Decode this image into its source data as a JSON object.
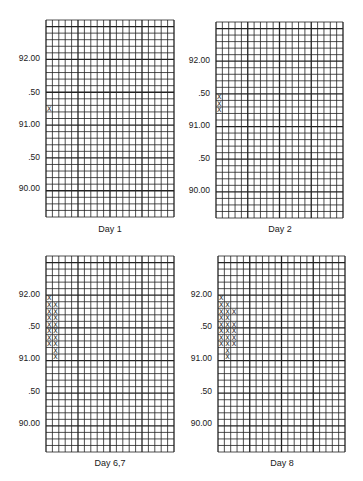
{
  "chart_data": [
    {
      "type": "heatmap",
      "title": "Day 1",
      "caption": "Day 1",
      "xlabel": "",
      "ylabel": "",
      "yticks": [
        "92.00",
        ".50",
        "91.00",
        ".50",
        "90.00"
      ],
      "ytick_values": [
        92.0,
        91.5,
        91.0,
        90.5,
        90.0
      ],
      "ylim": [
        89.6,
        92.6
      ],
      "grid": true,
      "grid_cols": 20,
      "grid_rows": 30,
      "cell_size": 0.1,
      "marks": [
        {
          "col": 0,
          "value": 91.2
        }
      ]
    },
    {
      "type": "heatmap",
      "title": "Day 2",
      "caption": "Day 2",
      "yticks": [
        "92.00",
        ".50",
        "91.00",
        ".50",
        "90.00"
      ],
      "ytick_values": [
        92.0,
        91.5,
        91.0,
        90.5,
        90.0
      ],
      "ylim": [
        89.6,
        92.6
      ],
      "grid": true,
      "grid_cols": 20,
      "grid_rows": 30,
      "cell_size": 0.1,
      "marks": [
        {
          "col": 0,
          "value": 91.4
        },
        {
          "col": 0,
          "value": 91.3
        },
        {
          "col": 0,
          "value": 91.2
        }
      ]
    },
    {
      "type": "heatmap",
      "title": "Day 6,7",
      "caption": "Day 6,7",
      "yticks": [
        "92.00",
        ".50",
        "91.00",
        ".50",
        "90.00"
      ],
      "ytick_values": [
        92.0,
        91.5,
        91.0,
        90.5,
        90.0
      ],
      "ylim": [
        89.6,
        92.6
      ],
      "grid": true,
      "grid_cols": 20,
      "grid_rows": 30,
      "cell_size": 0.1,
      "marks": [
        {
          "col": 0,
          "value": 91.9
        },
        {
          "col": 0,
          "value": 91.8
        },
        {
          "col": 1,
          "value": 91.8
        },
        {
          "col": 0,
          "value": 91.7
        },
        {
          "col": 1,
          "value": 91.7
        },
        {
          "col": 0,
          "value": 91.6
        },
        {
          "col": 1,
          "value": 91.6
        },
        {
          "col": 0,
          "value": 91.5
        },
        {
          "col": 1,
          "value": 91.5
        },
        {
          "col": 0,
          "value": 91.4
        },
        {
          "col": 1,
          "value": 91.4
        },
        {
          "col": 0,
          "value": 91.3
        },
        {
          "col": 1,
          "value": 91.3
        },
        {
          "col": 0,
          "value": 91.2
        },
        {
          "col": 1,
          "value": 91.2
        },
        {
          "col": 1,
          "value": 91.1
        },
        {
          "col": 1,
          "value": 91.0
        }
      ]
    },
    {
      "type": "heatmap",
      "title": "Day 8",
      "caption": "Day 8",
      "yticks": [
        "92.00",
        ".50",
        "91.00",
        ".50",
        "90.00"
      ],
      "ytick_values": [
        92.0,
        91.5,
        91.0,
        90.5,
        90.0
      ],
      "ylim": [
        89.6,
        92.6
      ],
      "grid": true,
      "grid_cols": 20,
      "grid_rows": 30,
      "cell_size": 0.1,
      "marks": [
        {
          "col": 0,
          "value": 91.9
        },
        {
          "col": 0,
          "value": 91.8
        },
        {
          "col": 1,
          "value": 91.8
        },
        {
          "col": 0,
          "value": 91.7
        },
        {
          "col": 1,
          "value": 91.7
        },
        {
          "col": 2,
          "value": 91.7
        },
        {
          "col": 0,
          "value": 91.6
        },
        {
          "col": 1,
          "value": 91.6
        },
        {
          "col": 0,
          "value": 91.5
        },
        {
          "col": 1,
          "value": 91.5
        },
        {
          "col": 2,
          "value": 91.5
        },
        {
          "col": 0,
          "value": 91.4
        },
        {
          "col": 1,
          "value": 91.4
        },
        {
          "col": 2,
          "value": 91.4
        },
        {
          "col": 0,
          "value": 91.3
        },
        {
          "col": 1,
          "value": 91.3
        },
        {
          "col": 2,
          "value": 91.3
        },
        {
          "col": 0,
          "value": 91.2
        },
        {
          "col": 1,
          "value": 91.2
        },
        {
          "col": 2,
          "value": 91.2
        },
        {
          "col": 1,
          "value": 91.1
        },
        {
          "col": 1,
          "value": 91.0
        }
      ]
    }
  ],
  "panels": [
    {
      "caption": "Day 1",
      "ticks": [
        "92.00",
        ".50",
        "91.00",
        ".50",
        "90.00"
      ]
    },
    {
      "caption": "Day 2",
      "ticks": [
        "92.00",
        ".50",
        "91.00",
        ".50",
        "90.00"
      ]
    },
    {
      "caption": "Day 6,7",
      "ticks": [
        "92.00",
        ".50",
        "91.00",
        ".50",
        "90.00"
      ]
    },
    {
      "caption": "Day 8",
      "ticks": [
        "92.00",
        ".50",
        "91.00",
        ".50",
        "90.00"
      ]
    }
  ],
  "marker_glyph": "X"
}
